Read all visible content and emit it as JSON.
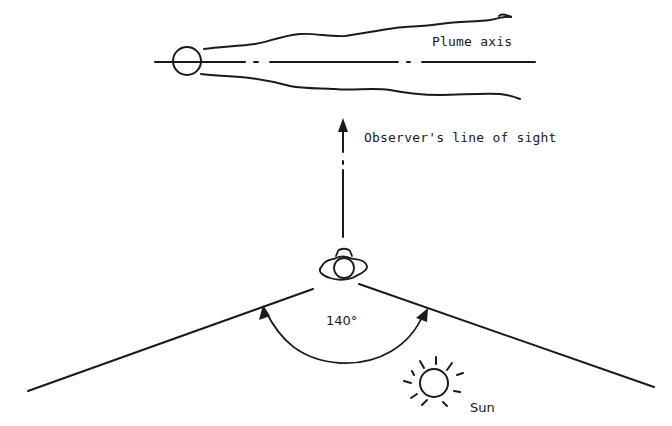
{
  "diagram": {
    "labels": {
      "plume_axis": "Plume axis",
      "line_of_sight": "Observer's line of sight",
      "angle": "140°",
      "sun": "Sun"
    },
    "icons": {
      "stack": "stack-circle-icon",
      "observer": "observer-person-icon",
      "sun": "sun-icon"
    },
    "angle_degrees": 140,
    "colors": {
      "ink": "#1a1a1a",
      "background": "#ffffff"
    }
  }
}
